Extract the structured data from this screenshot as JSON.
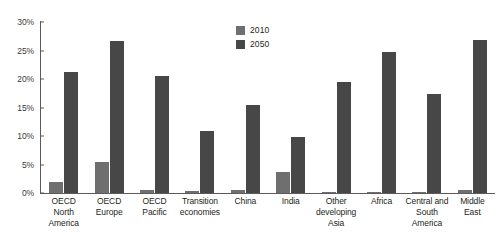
{
  "chart_data": {
    "type": "bar",
    "title": "",
    "subtitle": "",
    "xlabel": "",
    "ylabel": "",
    "ylim": [
      0,
      30
    ],
    "yticks": [
      "0%",
      "5%",
      "10%",
      "15%",
      "20%",
      "25%",
      "30%"
    ],
    "ytick_values": [
      0,
      5,
      10,
      15,
      20,
      25,
      30
    ],
    "grid": false,
    "legend_position": "top-center",
    "categories": [
      "OECD North America",
      "OECD Europe",
      "OECD Pacific",
      "Transition economies",
      "China",
      "India",
      "Other developing Asia",
      "Africa",
      "Central and South America",
      "Middle East"
    ],
    "series": [
      {
        "name": "2010",
        "color": "#6f6f6f",
        "values": [
          1.9,
          5.5,
          0.6,
          0.3,
          0.6,
          3.7,
          0.1,
          0.2,
          0.1,
          0.6
        ]
      },
      {
        "name": "2050",
        "color": "#474747",
        "values": [
          21.2,
          26.6,
          20.5,
          10.8,
          15.5,
          9.9,
          19.5,
          24.7,
          17.3,
          26.8
        ]
      }
    ],
    "annotations": []
  },
  "legend": {
    "items": [
      {
        "label": "2010"
      },
      {
        "label": "2050"
      }
    ]
  },
  "axis": {
    "y_ticks": [
      {
        "label": "30%"
      },
      {
        "label": "25%"
      },
      {
        "label": "20%"
      },
      {
        "label": "15%"
      },
      {
        "label": "10%"
      },
      {
        "label": "5%"
      },
      {
        "label": "0%"
      }
    ],
    "x_labels": [
      {
        "line1": "OECD North",
        "line2": "America"
      },
      {
        "line1": "OECD",
        "line2": "Europe"
      },
      {
        "line1": "OECD",
        "line2": "Pacific"
      },
      {
        "line1": "Transition",
        "line2": "economies"
      },
      {
        "line1": "China",
        "line2": ""
      },
      {
        "line1": "India",
        "line2": ""
      },
      {
        "line1": "Other",
        "line2": "developing Asia"
      },
      {
        "line1": "Africa",
        "line2": ""
      },
      {
        "line1": "Central and",
        "line2": "South America"
      },
      {
        "line1": "Middle",
        "line2": "East"
      }
    ]
  },
  "colors": {
    "series_2010": "#6f6f6f",
    "series_2050": "#474747",
    "axis": "#5b5b5b",
    "text": "#231f20",
    "background": "#ffffff"
  }
}
